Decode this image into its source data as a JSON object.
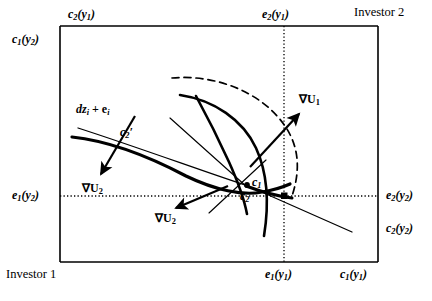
{
  "figure": {
    "kind": "edgeworth-box",
    "corners": {
      "top_right": "Investor 2",
      "bottom_left": "Investor 1"
    },
    "axis_labels": {
      "top_left": "c",
      "top_left_sub": "2",
      "top_left_arg": "(y",
      "top_left_argsub": "1",
      "top_left_close": ")",
      "top_endow": "e",
      "top_endow_sub": "2",
      "top_endow_arg": "(y",
      "top_endow_argsub": "1",
      "top_endow_close": ")",
      "left_top": "c",
      "left_top_sub": "1",
      "left_top_arg": "(y",
      "left_top_argsub": "2",
      "left_top_close": ")",
      "left_endow": "e",
      "left_endow_sub": "1",
      "left_endow_arg": "(y",
      "left_endow_argsub": "2",
      "left_endow_close": ")",
      "right_endow": "e",
      "right_endow_sub": "2",
      "right_endow_arg": "(y",
      "right_endow_argsub": "2",
      "right_endow_close": ")",
      "right_cons": "c",
      "right_cons_sub": "2",
      "right_cons_arg": "(y",
      "right_cons_argsub": "2",
      "right_cons_close": ")",
      "bottom_endow": "e",
      "bottom_endow_sub": "1",
      "bottom_endow_arg": "(y",
      "bottom_endow_argsub": "1",
      "bottom_endow_close": ")",
      "bottom_cons": "c",
      "bottom_cons_sub": "1",
      "bottom_cons_arg": "(y",
      "bottom_cons_argsub": "1",
      "bottom_cons_close": ")"
    },
    "annotations": {
      "budget_line": "dz",
      "budget_line_sub": "i",
      "budget_line_plus": " + e",
      "budget_line_sub2": "i",
      "c2_prime": "c",
      "c2_prime_sub": "2",
      "c2_prime_mark": "′",
      "grad_u1": "∇U",
      "grad_u1_sub": "1",
      "grad_u2_left": "∇U",
      "grad_u2_left_sub": "2",
      "grad_u2_mid": "∇U",
      "grad_u2_mid_sub": "2",
      "point_c1": "c",
      "point_c1_sub": "1",
      "point_c2": "c",
      "point_c2_sub": "2"
    },
    "colors": {
      "ink": "#000000",
      "paper": "#ffffff"
    },
    "geometry": {
      "box_left": 60,
      "box_top": 26,
      "box_right": 378,
      "box_bottom": 262,
      "dotted_vertical_x": 284,
      "dotted_horizontal_y": 196
    }
  }
}
